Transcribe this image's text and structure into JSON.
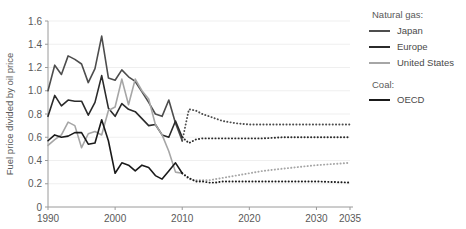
{
  "chart_data": {
    "type": "line",
    "title": "",
    "xlabel": "",
    "ylabel": "Fuel price divided by oil price",
    "xlim": [
      1990,
      2035
    ],
    "ylim": [
      0,
      1.6
    ],
    "yticks": [
      "0",
      "0.2",
      "0.4",
      "0.6",
      "0.8",
      "1.0",
      "1.2",
      "1.4",
      "1.6"
    ],
    "ytick_values": [
      0,
      0.2,
      0.4,
      0.6,
      0.8,
      1.0,
      1.2,
      1.4,
      1.6
    ],
    "xticks": [
      "1990",
      "2000",
      "2010",
      "2020",
      "2030",
      "2035"
    ],
    "xtick_values": [
      1990,
      2000,
      2010,
      2020,
      2030,
      2035
    ],
    "grid": true,
    "grid_axis": "y",
    "legend_position": "right",
    "note": "Solid segments are historical (1990-2010); dotted segments are projections (2010-2035).",
    "series": [
      {
        "name": "Japan",
        "group": "Natural gas:",
        "color": "#4d4d4d",
        "x": [
          1990,
          1991,
          1992,
          1993,
          1994,
          1995,
          1996,
          1997,
          1998,
          1999,
          2000,
          2001,
          2002,
          2003,
          2004,
          2005,
          2006,
          2007,
          2008,
          2009,
          2010
        ],
        "values": [
          1.0,
          1.22,
          1.14,
          1.3,
          1.27,
          1.23,
          1.07,
          1.19,
          1.47,
          1.11,
          1.09,
          1.18,
          1.12,
          1.08,
          0.99,
          0.9,
          0.8,
          0.78,
          0.92,
          0.72,
          0.57
        ],
        "projection_x": [
          2010,
          2011,
          2012,
          2013,
          2014,
          2015,
          2016,
          2017,
          2018,
          2020,
          2022,
          2025,
          2030,
          2035
        ],
        "projection_values": [
          0.57,
          0.84,
          0.83,
          0.8,
          0.78,
          0.76,
          0.74,
          0.73,
          0.72,
          0.71,
          0.71,
          0.71,
          0.71,
          0.71
        ]
      },
      {
        "name": "Europe",
        "group": "Natural gas:",
        "color": "#2b2b2b",
        "x": [
          1990,
          1991,
          1992,
          1993,
          1994,
          1995,
          1996,
          1997,
          1998,
          1999,
          2000,
          2001,
          2002,
          2003,
          2004,
          2005,
          2006,
          2007,
          2008,
          2009,
          2010
        ],
        "values": [
          0.78,
          0.96,
          0.87,
          0.92,
          0.91,
          0.91,
          0.79,
          0.9,
          1.13,
          0.85,
          0.78,
          0.89,
          0.84,
          0.82,
          0.76,
          0.7,
          0.71,
          0.62,
          0.6,
          0.74,
          0.6
        ],
        "projection_x": [
          2010,
          2011,
          2012,
          2013,
          2014,
          2015,
          2016,
          2017,
          2018,
          2020,
          2022,
          2025,
          2030,
          2035
        ],
        "projection_values": [
          0.6,
          0.55,
          0.58,
          0.59,
          0.59,
          0.59,
          0.59,
          0.59,
          0.59,
          0.59,
          0.59,
          0.6,
          0.6,
          0.6
        ]
      },
      {
        "name": "United States",
        "group": "Natural gas:",
        "color": "#a6a6a6",
        "x": [
          1990,
          1991,
          1992,
          1993,
          1994,
          1995,
          1996,
          1997,
          1998,
          1999,
          2000,
          2001,
          2002,
          2003,
          2004,
          2005,
          2006,
          2007,
          2008,
          2009,
          2010
        ],
        "values": [
          0.53,
          0.58,
          0.62,
          0.73,
          0.7,
          0.51,
          0.63,
          0.65,
          0.62,
          0.83,
          0.86,
          1.1,
          0.88,
          1.1,
          1.0,
          0.93,
          0.71,
          0.62,
          0.48,
          0.3,
          0.29
        ],
        "projection_x": [
          2010,
          2011,
          2012,
          2013,
          2014,
          2015,
          2016,
          2017,
          2018,
          2020,
          2022,
          2025,
          2030,
          2035
        ],
        "projection_values": [
          0.29,
          0.24,
          0.23,
          0.23,
          0.23,
          0.24,
          0.25,
          0.26,
          0.27,
          0.29,
          0.31,
          0.33,
          0.36,
          0.38
        ]
      },
      {
        "name": "OECD",
        "group": "Coal:",
        "color": "#1a1a1a",
        "x": [
          1990,
          1991,
          1992,
          1993,
          1994,
          1995,
          1996,
          1997,
          1998,
          1999,
          2000,
          2001,
          2002,
          2003,
          2004,
          2005,
          2006,
          2007,
          2008,
          2009,
          2010
        ],
        "values": [
          0.57,
          0.62,
          0.6,
          0.61,
          0.64,
          0.64,
          0.54,
          0.55,
          0.75,
          0.57,
          0.29,
          0.38,
          0.36,
          0.31,
          0.36,
          0.34,
          0.27,
          0.24,
          0.31,
          0.38,
          0.29
        ],
        "projection_x": [
          2010,
          2011,
          2012,
          2013,
          2014,
          2015,
          2016,
          2017,
          2018,
          2020,
          2022,
          2025,
          2030,
          2035
        ],
        "projection_values": [
          0.29,
          0.25,
          0.22,
          0.22,
          0.21,
          0.21,
          0.22,
          0.22,
          0.22,
          0.22,
          0.22,
          0.22,
          0.22,
          0.21
        ]
      }
    ]
  },
  "legend": {
    "groups": [
      {
        "header": "Natural gas:",
        "items": [
          {
            "label": "Japan",
            "color": "#4d4d4d"
          },
          {
            "label": "Europe",
            "color": "#2b2b2b"
          },
          {
            "label": "United States",
            "color": "#a6a6a6"
          }
        ]
      },
      {
        "header": "Coal:",
        "items": [
          {
            "label": "OECD",
            "color": "#1a1a1a"
          }
        ]
      }
    ]
  },
  "axes": {
    "y_title": "Fuel price divided by oil price",
    "y_ticks": [
      "1.6",
      "1.4",
      "1.2",
      "1.0",
      "0.8",
      "0.6",
      "0.4",
      "0.2",
      "0"
    ],
    "x_ticks": [
      "1990",
      "2000",
      "2010",
      "2020",
      "2030",
      "2035"
    ]
  }
}
